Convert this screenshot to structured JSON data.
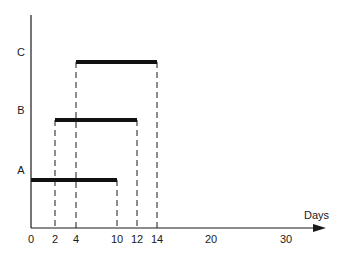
{
  "chart_data": {
    "type": "gantt",
    "title": "",
    "xlabel": "Days",
    "ylabel": "",
    "x_ticks": [
      0,
      2,
      4,
      10,
      12,
      14,
      20,
      30
    ],
    "tasks": [
      {
        "name": "A",
        "start": 0,
        "end": 10
      },
      {
        "name": "B",
        "start": 2,
        "end": 12
      },
      {
        "name": "C",
        "start": 4,
        "end": 14
      }
    ],
    "dashed_guides": [
      2,
      4,
      10,
      12,
      14
    ],
    "grid": false,
    "legend": "none",
    "colors": {
      "bar": "#111111",
      "axis": "#1a1a1a"
    }
  }
}
